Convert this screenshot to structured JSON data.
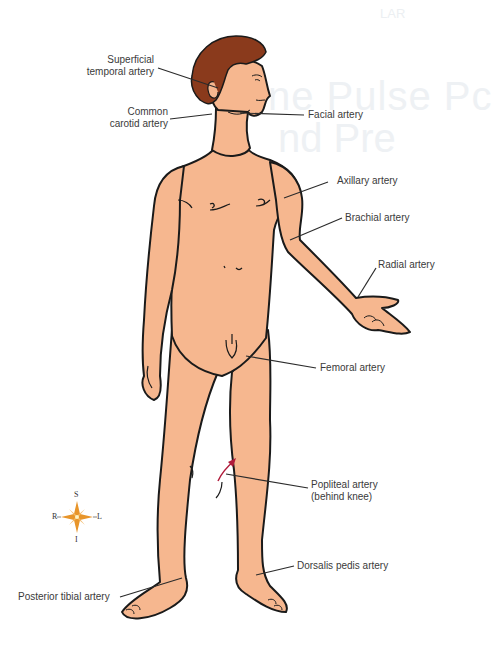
{
  "diagram": {
    "background_bleed": [
      "ne Pulse Pc",
      "nd Pre",
      "LAR"
    ],
    "colors": {
      "skin": "#f6b78f",
      "hair": "#8a3a1c",
      "outline": "#1a1a1a",
      "leader_line": "#2b2b2b",
      "label_text": "#3a3a3a",
      "arrow": "#b01a3a",
      "compass": "#e8952a"
    },
    "labels": {
      "superficial_temporal": [
        "Superficial",
        "temporal artery"
      ],
      "common_carotid": [
        "Common",
        "carotid artery"
      ],
      "facial": "Facial artery",
      "axillary": "Axillary artery",
      "brachial": "Brachial artery",
      "radial": "Radial artery",
      "femoral": "Femoral artery",
      "popliteal": [
        "Popliteal artery",
        "(behind knee)"
      ],
      "dorsalis_pedis": "Dorsalis pedis artery",
      "posterior_tibial": "Posterior tibial artery"
    },
    "compass": {
      "top": "S",
      "bottom": "I",
      "left": "R",
      "right": "L"
    }
  }
}
